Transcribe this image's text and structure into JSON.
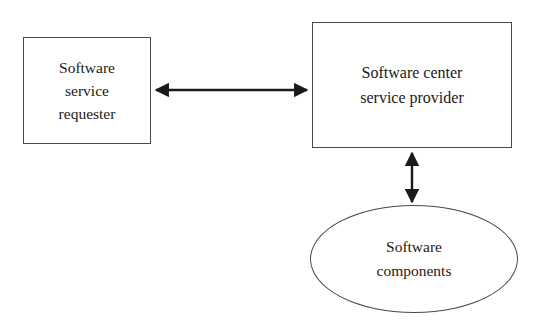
{
  "diagram": {
    "background_color": "#ffffff",
    "stroke_color": "#4a4a4a",
    "arrow_color": "#1a1a1a",
    "text_color": "#1a1a1a",
    "nodes": [
      {
        "id": "requester",
        "shape": "rectangle",
        "lines": [
          "Software",
          "service",
          "requester"
        ],
        "label": "Software service requester",
        "x": 23,
        "y": 37,
        "width": 128,
        "height": 107
      },
      {
        "id": "provider",
        "shape": "rectangle",
        "lines": [
          "Software center",
          "service provider"
        ],
        "label": "Software center service provider",
        "x": 312,
        "y": 22,
        "width": 200,
        "height": 126
      },
      {
        "id": "components",
        "shape": "ellipse",
        "lines": [
          "Software",
          "components"
        ],
        "label": "Software components",
        "x": 310,
        "y": 205,
        "width": 208,
        "height": 108
      }
    ],
    "connectors": [
      {
        "id": "requester-provider",
        "from": "requester",
        "to": "provider",
        "orientation": "horizontal",
        "arrowheads": "both",
        "x1": 152,
        "y1": 90,
        "x2": 311,
        "y2": 90
      },
      {
        "id": "provider-components",
        "from": "provider",
        "to": "components",
        "orientation": "vertical",
        "arrowheads": "both",
        "x1": 412,
        "y1": 149,
        "x2": 412,
        "y2": 205
      }
    ]
  }
}
